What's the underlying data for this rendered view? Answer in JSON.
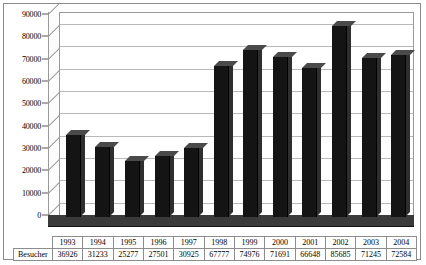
{
  "chart_data": {
    "type": "bar",
    "title": "",
    "subtitle": "",
    "xlabel": "",
    "ylabel": "",
    "categories": [
      "1993",
      "1994",
      "1995",
      "1996",
      "1997",
      "1998",
      "1999",
      "2000",
      "2001",
      "2002",
      "2003",
      "2004"
    ],
    "series": [
      {
        "name": "Besucher",
        "values": [
          36926,
          31233,
          25277,
          27501,
          30925,
          67777,
          74976,
          71691,
          66648,
          85685,
          71245,
          72584
        ]
      }
    ],
    "values": [
      36926,
      31233,
      25277,
      27501,
      30925,
      67777,
      74976,
      71691,
      66648,
      85685,
      71245,
      72584
    ],
    "ylim": [
      0,
      90000
    ],
    "y_ticks": [
      "0",
      "10000",
      "20000",
      "30000",
      "40000",
      "50000",
      "60000",
      "70000",
      "80000",
      "90000"
    ],
    "y_tick_values": [
      0,
      10000,
      20000,
      30000,
      40000,
      50000,
      60000,
      70000,
      80000,
      90000
    ],
    "y_tick_step": 10000,
    "grid": true,
    "legend": false,
    "legend_position": "none",
    "three_d": true,
    "bar_color": "#141414",
    "grid_color": "#b9b9b9",
    "axis_color": "#9a9a9a",
    "background_color": "#ffffff"
  },
  "table": {
    "row_label": "Besucher",
    "header_row": [
      "1993",
      "1994",
      "1995",
      "1996",
      "1997",
      "1998",
      "1999",
      "2000",
      "2001",
      "2002",
      "2003",
      "2004"
    ],
    "value_row": [
      "36926",
      "31233",
      "25277",
      "27501",
      "30925",
      "67777",
      "74976",
      "71691",
      "66648",
      "85685",
      "71245",
      "72584"
    ]
  }
}
